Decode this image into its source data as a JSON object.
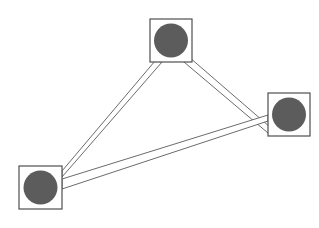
{
  "canvas": {
    "width": 319,
    "height": 228,
    "background_color": "#ffffff"
  },
  "diagram": {
    "type": "node-link-graph",
    "node_count": 3,
    "edge_count": 3,
    "node_box_stroke_color": "#4f4f4f",
    "node_box_fill_color": "#ffffff",
    "node_circle_color": "#5c5c5c",
    "edge_stroke_color": "#5a5a5a",
    "edge_fill_color": "#ffffff",
    "edge_style": "double-parallel-line-ribbon"
  },
  "nodes": [
    {
      "id": "node-top",
      "label": "",
      "box": {
        "x": 150,
        "y": 19,
        "width": 42,
        "height": 43
      },
      "circle": {
        "cx": 171,
        "cy": 40.5,
        "r": 17
      }
    },
    {
      "id": "node-right",
      "label": "",
      "box": {
        "x": 268,
        "y": 93,
        "width": 42,
        "height": 43
      },
      "circle": {
        "cx": 289,
        "cy": 114.5,
        "r": 17
      }
    },
    {
      "id": "node-bottom-left",
      "label": "",
      "box": {
        "x": 19,
        "y": 166,
        "width": 43,
        "height": 43
      },
      "circle": {
        "cx": 40.5,
        "cy": 187.5,
        "r": 17
      }
    }
  ],
  "edges": [
    {
      "id": "edge-top-bottomleft",
      "source": "node-top",
      "target": "node-bottom-left",
      "label": "",
      "ribbon_points": "155,61 62,171 62,177 162,62"
    },
    {
      "id": "edge-top-right",
      "source": "node-top",
      "target": "node-right",
      "label": "",
      "ribbon_points": "189,57 270,127 268,133 184,62"
    },
    {
      "id": "edge-bottomleft-right",
      "source": "node-bottom-left",
      "target": "node-right",
      "label": "",
      "ribbon_points": "62,179 268,115 268,121 62,189"
    }
  ]
}
